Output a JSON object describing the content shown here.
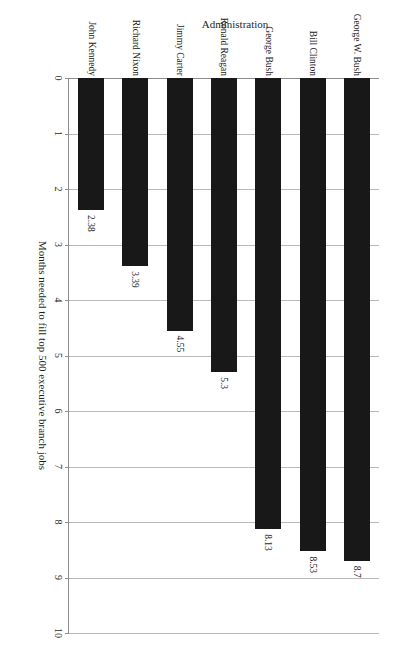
{
  "chart_data": {
    "type": "bar",
    "orientation": "horizontal",
    "title": "",
    "xlabel": "Months needed to fill top 500 executive branch jobs",
    "ylabel": "Administration",
    "categories": [
      "John Kennedy",
      "Richard Nixon",
      "Jimmy Carter",
      "Ronald Reagan",
      "George Bush",
      "Bill Clinton",
      "George W. Bush"
    ],
    "values": [
      2.38,
      3.39,
      4.55,
      5.3,
      8.13,
      8.53,
      8.7
    ],
    "value_labels": [
      "2.38",
      "3.39",
      "4.55",
      "5.3",
      "8.13",
      "8.53",
      "8.7"
    ],
    "xlim": [
      0,
      10
    ],
    "ticks": [
      "0",
      "1",
      "2",
      "3",
      "4",
      "5",
      "6",
      "7",
      "8",
      "9",
      "10"
    ],
    "tick_values": [
      0,
      1,
      2,
      3,
      4,
      5,
      6,
      7,
      8,
      9,
      10
    ],
    "grid": true,
    "legend": false,
    "bar_color": "#181818",
    "grid_color": "#b9b9b9",
    "axis_color": "#8d8d8d",
    "background": "#ffffff",
    "page_rotation_degrees": 180
  }
}
